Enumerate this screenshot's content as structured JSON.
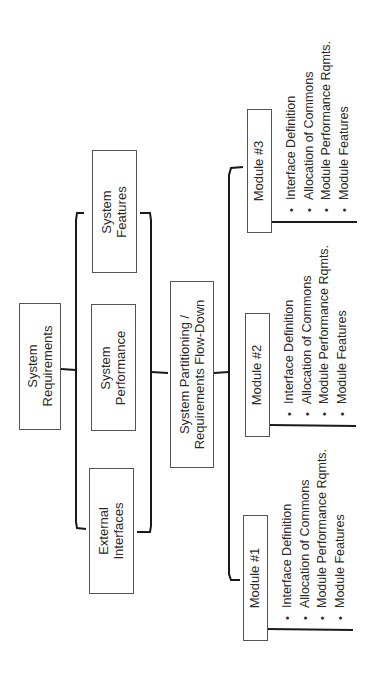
{
  "diagram": {
    "orientation": "rotated-90-ccw",
    "colors": {
      "line": "#1a1a1a",
      "box_border": "#555555",
      "text": "#2a2a2a",
      "background": "#ffffff"
    },
    "top": {
      "line1": "System",
      "line2": "Requirements"
    },
    "level1": [
      {
        "id": "external",
        "line1": "External",
        "line2": "Interfaces"
      },
      {
        "id": "performance",
        "line1": "System",
        "line2": "Performance"
      },
      {
        "id": "features",
        "line1": "System",
        "line2": "Features"
      }
    ],
    "partition": {
      "line1": "System Partitioning /",
      "line2": "Requirements Flow-Down"
    },
    "modules": [
      {
        "label": "Module #1",
        "items": [
          "Interface Definition",
          "Allocation of Commons",
          "Module Performance Rqmts.",
          "Module Features"
        ]
      },
      {
        "label": "Module #2",
        "items": [
          "Interface Definition",
          "Allocation of Commons",
          "Module Performance Rqmts.",
          "Module Features"
        ]
      },
      {
        "label": "Module #3",
        "items": [
          "Interface Definition",
          "Allocation of Commons",
          "Module Performance Rqmts.",
          "Module Features"
        ]
      }
    ]
  }
}
